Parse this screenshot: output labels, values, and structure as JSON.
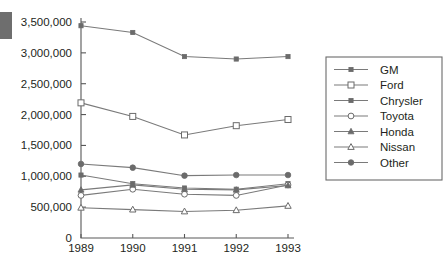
{
  "chart_data": {
    "type": "line",
    "title": "",
    "subtitle": "",
    "xlabel": "",
    "ylabel": "",
    "categories": [
      "1989",
      "1990",
      "1991",
      "1992",
      "1993"
    ],
    "x": [
      1989,
      1990,
      1991,
      1992,
      1993
    ],
    "ylim": [
      0,
      3500000
    ],
    "ytick_labels": [
      "0",
      "500,000",
      "1,000,000",
      "1,500,000",
      "2,000,000",
      "2,500,000",
      "3,000,000",
      "3,500,000"
    ],
    "ytick_values": [
      0,
      500000,
      1000000,
      1500000,
      2000000,
      2500000,
      3000000,
      3500000
    ],
    "grid": false,
    "legend_position": "right",
    "series": [
      {
        "name": "GM",
        "marker": "filled-square",
        "values": [
          3440000,
          3330000,
          2940000,
          2900000,
          2940000
        ]
      },
      {
        "name": "Ford",
        "marker": "open-square",
        "values": [
          2190000,
          1970000,
          1670000,
          1820000,
          1920000
        ]
      },
      {
        "name": "Chrysler",
        "marker": "filled-square",
        "values": [
          1020000,
          880000,
          810000,
          790000,
          880000
        ]
      },
      {
        "name": "Toyota",
        "marker": "open-circle",
        "values": [
          690000,
          790000,
          710000,
          690000,
          860000
        ]
      },
      {
        "name": "Honda",
        "marker": "filled-triangle",
        "values": [
          780000,
          860000,
          790000,
          780000,
          850000
        ]
      },
      {
        "name": "Nissan",
        "marker": "open-triangle",
        "values": [
          490000,
          460000,
          430000,
          450000,
          520000
        ]
      },
      {
        "name": "Other",
        "marker": "filled-circle",
        "values": [
          1200000,
          1140000,
          1010000,
          1020000,
          1020000
        ]
      }
    ]
  },
  "colors": {
    "line": "#7a7a7a",
    "axis": "#585858",
    "text": "#231f20",
    "marker_fill": "#6b6b6b",
    "marker_open_fill": "#ffffff",
    "background": "#ffffff",
    "corner_block": "#6e6e6e"
  }
}
